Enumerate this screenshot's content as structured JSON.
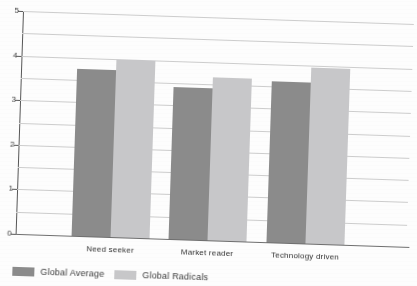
{
  "chart_data": {
    "type": "bar",
    "title": "",
    "xlabel": "",
    "ylabel": "",
    "categories": [
      "Need seeker",
      "Market reader",
      "Technology driven"
    ],
    "series": [
      {
        "name": "Global Average",
        "color": "#8b8b8b",
        "values": [
          3.75,
          3.4,
          3.6
        ]
      },
      {
        "name": "Global Radicals",
        "color": "#c7c7c9",
        "values": [
          4.0,
          3.65,
          3.95
        ]
      }
    ],
    "ylim": [
      0,
      5
    ],
    "yticks": [
      0,
      1,
      2,
      3,
      4,
      5
    ],
    "gridline_step": 0.5,
    "grid": true,
    "legend_position": "bottom-left",
    "legend": [
      "Global Average",
      "Global Radicals"
    ]
  },
  "style": {
    "background": "#fdfdfd",
    "gridline_color": "#cccccc",
    "baseline_color": "#6e6e6e",
    "axis_color": "#565656",
    "text_color": "#3a3a3a",
    "scan_tilt_deg": 1.9
  }
}
